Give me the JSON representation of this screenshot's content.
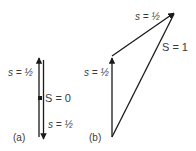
{
  "diagram": {
    "panel_a": {
      "caption": "(a)",
      "up_spin_label": "s = ½",
      "down_spin_label": "s = ½",
      "total_label": "S = 0"
    },
    "panel_b": {
      "caption": "(b)",
      "first_spin_label": "s = ½",
      "second_spin_label": "s = ½",
      "total_label": "S = 1"
    },
    "colors": {
      "line": "#1a1a1a",
      "text": "#3a3a3a",
      "background": "#ffffff"
    }
  }
}
